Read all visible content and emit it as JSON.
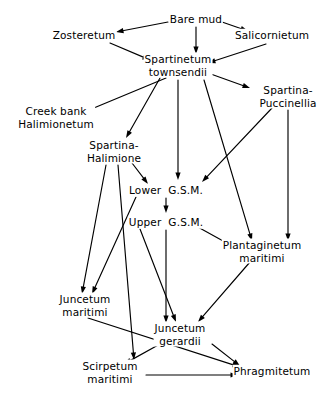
{
  "diagram": {
    "type": "flow-diagram",
    "style": {
      "background": "#ffffff",
      "line_color": "#000000",
      "text_color": "#000000"
    },
    "nodes": [
      {
        "id": "bare_mud",
        "label": "Bare mud",
        "lines": [
          "Bare mud"
        ],
        "x": 196,
        "y": 19
      },
      {
        "id": "zosteretum",
        "label": "Zosteretum",
        "lines": [
          "Zosteretum"
        ],
        "x": 84,
        "y": 35
      },
      {
        "id": "salicornietum",
        "label": "Salicornietum",
        "lines": [
          "Salicornietum"
        ],
        "x": 272,
        "y": 35
      },
      {
        "id": "spartinetum",
        "label": "Spartinetum townsendii",
        "lines": [
          "Spartinetum",
          "townsendii"
        ],
        "x": 178,
        "y": 65
      },
      {
        "id": "spartina_pucc",
        "label": "Spartina-Puccinellia",
        "lines": [
          "Spartina-",
          "Puccinellia"
        ],
        "x": 288,
        "y": 96
      },
      {
        "id": "creek_bank",
        "label": "Creek bank Halimionetum",
        "lines": [
          "Creek bank",
          "Halimionetum"
        ],
        "x": 56,
        "y": 117
      },
      {
        "id": "spartina_halim",
        "label": "Spartina-Halimione",
        "lines": [
          "Spartina-",
          "Halimione"
        ],
        "x": 114,
        "y": 151
      },
      {
        "id": "lower_gsm",
        "label": "Lower G.S.M.",
        "lines": [
          "Lower  G.S.M."
        ],
        "x": 166,
        "y": 190
      },
      {
        "id": "upper_gsm",
        "label": "Upper G.S.M.",
        "lines": [
          "Upper  G.S.M."
        ],
        "x": 166,
        "y": 222
      },
      {
        "id": "plantaginetum",
        "label": "Plantaginetum maritimi",
        "lines": [
          "Plantaginetum",
          "maritimi"
        ],
        "x": 262,
        "y": 251
      },
      {
        "id": "juncetum_mar",
        "label": "Juncetum maritimi",
        "lines": [
          "Juncetum",
          "maritimi"
        ],
        "x": 85,
        "y": 305
      },
      {
        "id": "juncetum_ger",
        "label": "Juncetum gerardii",
        "lines": [
          "Juncetum",
          "gerardii"
        ],
        "x": 180,
        "y": 334
      },
      {
        "id": "scirpetum",
        "label": "Scirpetum maritimi",
        "lines": [
          "Scirpetum",
          "maritimi"
        ],
        "x": 110,
        "y": 372
      },
      {
        "id": "phragmitetum",
        "label": "Phragmitetum",
        "lines": [
          "Phragmitetum"
        ],
        "x": 272,
        "y": 371
      }
    ],
    "edges": [
      {
        "from": "bare_mud",
        "to": "zosteretum",
        "points": [
          [
            168,
            22
          ],
          [
            116,
            32
          ]
        ]
      },
      {
        "from": "bare_mud",
        "to": "salicornietum",
        "points": [
          [
            222,
            22
          ],
          [
            248,
            31
          ]
        ]
      },
      {
        "from": "bare_mud",
        "to": "spartinetum",
        "points": [
          [
            196,
            27
          ],
          [
            196,
            54
          ]
        ]
      },
      {
        "from": "zosteretum",
        "to": "spartinetum",
        "points": [
          [
            110,
            43
          ],
          [
            150,
            60
          ]
        ]
      },
      {
        "from": "salicornietum",
        "to": "spartinetum",
        "points": [
          [
            266,
            44
          ],
          [
            208,
            63
          ]
        ]
      },
      {
        "from": "spartinetum",
        "to": "creek_bank",
        "points": [
          [
            166,
            78
          ],
          [
            84,
            112
          ]
        ]
      },
      {
        "from": "spartinetum",
        "to": "spartina_halim",
        "points": [
          [
            160,
            78
          ],
          [
            126,
            138
          ]
        ]
      },
      {
        "from": "spartinetum",
        "to": "lower_gsm",
        "points": [
          [
            178,
            80
          ],
          [
            178,
            180
          ]
        ]
      },
      {
        "from": "spartinetum",
        "to": "spartina_pucc",
        "points": [
          [
            208,
            73
          ],
          [
            250,
            88
          ]
        ]
      },
      {
        "from": "spartinetum",
        "to": "plantaginetum",
        "points": [
          [
            204,
            80
          ],
          [
            252,
            241
          ]
        ]
      },
      {
        "from": "spartina_pucc",
        "to": "lower_gsm",
        "points": [
          [
            272,
            108
          ],
          [
            202,
            182
          ]
        ]
      },
      {
        "from": "spartina_pucc",
        "to": "plantaginetum",
        "points": [
          [
            288,
            110
          ],
          [
            288,
            241
          ]
        ]
      },
      {
        "from": "spartina_halim",
        "to": "lower_gsm",
        "points": [
          [
            132,
            163
          ],
          [
            148,
            184
          ]
        ]
      },
      {
        "from": "spartina_halim",
        "to": "juncetum_mar",
        "points": [
          [
            106,
            165
          ],
          [
            82,
            294
          ]
        ]
      },
      {
        "from": "spartina_halim",
        "to": "scirpetum",
        "points": [
          [
            118,
            165
          ],
          [
            134,
            360
          ]
        ]
      },
      {
        "from": "lower_gsm",
        "to": "upper_gsm",
        "points": [
          [
            166,
            198
          ],
          [
            166,
            213
          ]
        ]
      },
      {
        "from": "lower_gsm",
        "to": "juncetum_mar",
        "points": [
          [
            136,
            197
          ],
          [
            92,
            294
          ]
        ]
      },
      {
        "from": "upper_gsm",
        "to": "juncetum_ger",
        "points": [
          [
            166,
            230
          ],
          [
            166,
            323
          ]
        ]
      },
      {
        "from": "upper_gsm",
        "to": "plantaginetum",
        "points": [
          [
            196,
            226
          ],
          [
            236,
            248
          ]
        ]
      },
      {
        "from": "upper_gsm",
        "to": "juncetum_ger",
        "points": [
          [
            140,
            229
          ],
          [
            176,
            322
          ]
        ]
      },
      {
        "from": "plantaginetum",
        "to": "juncetum_ger",
        "points": [
          [
            250,
            262
          ],
          [
            198,
            322
          ]
        ]
      },
      {
        "from": "juncetum_mar",
        "to": "phragmitetum",
        "points": [
          [
            88,
            318
          ],
          [
            240,
            367
          ]
        ]
      },
      {
        "from": "juncetum_ger",
        "to": "scirpetum",
        "points": [
          [
            160,
            344
          ],
          [
            124,
            364
          ]
        ]
      },
      {
        "from": "juncetum_ger",
        "to": "phragmitetum",
        "points": [
          [
            212,
            344
          ],
          [
            240,
            366
          ]
        ]
      },
      {
        "from": "scirpetum",
        "to": "phragmitetum",
        "points": [
          [
            146,
            375
          ],
          [
            238,
            375
          ]
        ]
      }
    ]
  }
}
